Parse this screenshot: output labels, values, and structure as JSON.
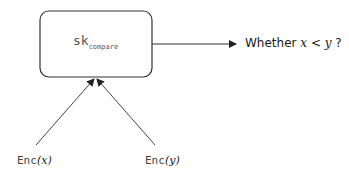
{
  "diagram": {
    "key_box": {
      "main": "sk",
      "subscript": "compare"
    },
    "result": {
      "prefix": "Whether ",
      "var_x": "x",
      "op": " < ",
      "var_y": "y",
      "suffix": " ?"
    },
    "inputs": [
      {
        "func": "Enc",
        "open": "(",
        "var": "x",
        "close": ")"
      },
      {
        "func": "Enc",
        "open": "(",
        "var": "y",
        "close": ")"
      }
    ],
    "colors": {
      "stroke": "#333333",
      "text": "#1a1a1a"
    }
  }
}
